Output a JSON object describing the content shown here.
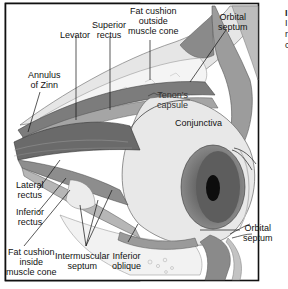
{
  "figure": {
    "labels": {
      "levator": "Levator",
      "superior_rectus_1": "Superior",
      "superior_rectus_2": "rectus",
      "fat_outside_1": "Fat cushion",
      "fat_outside_2": "outside",
      "fat_outside_3": "muscle cone",
      "orbital_septum_top_1": "Orbital",
      "orbital_septum_top_2": "septum",
      "annulus_1": "Annulus",
      "annulus_2": "of Zinn",
      "tenons_1": "Tenon's",
      "tenons_2": "capsule",
      "conjunctiva": "Conjunctiva",
      "lateral_rectus_1": "Lateral",
      "lateral_rectus_2": "rectus",
      "inferior_rectus_1": "Inferior",
      "inferior_rectus_2": "rectus",
      "fat_inside_1": "Fat cushion",
      "fat_inside_2": "inside",
      "fat_inside_3": "muscle cone",
      "intermuscular_1": "Intermuscular",
      "intermuscular_2": "septum",
      "inferior_oblique_1": "Inferior",
      "inferior_oblique_2": "oblique",
      "orbital_septum_bottom_1": "Orbital",
      "orbital_septum_bottom_2": "septum"
    }
  },
  "side_text": {
    "line1": "I",
    "line2": "I",
    "line3": "r",
    "line4": "c"
  }
}
